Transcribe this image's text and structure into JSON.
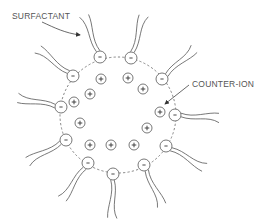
{
  "diagram": {
    "labels": {
      "surfactant": "SURFACTANT",
      "counter_ion": "COUNTER-ION"
    },
    "colors": {
      "line": "#555555",
      "dashed_boundary": "#777777",
      "background": "#ffffff"
    },
    "boundary": {
      "cx": 118,
      "cy": 115,
      "r": 58
    },
    "surfactant_heads": [
      {
        "x": 100,
        "y": 57,
        "charge": "-",
        "tail_dir": "up"
      },
      {
        "x": 131,
        "y": 58,
        "charge": "-",
        "tail_dir": "up-right"
      },
      {
        "x": 162,
        "y": 79,
        "charge": "-",
        "tail_dir": "right-up"
      },
      {
        "x": 175,
        "y": 115,
        "charge": "-",
        "tail_dir": "right"
      },
      {
        "x": 166,
        "y": 146,
        "charge": "-",
        "tail_dir": "right-down"
      },
      {
        "x": 144,
        "y": 165,
        "charge": "-",
        "tail_dir": "down-right"
      },
      {
        "x": 113,
        "y": 174,
        "charge": "-",
        "tail_dir": "down"
      },
      {
        "x": 88,
        "y": 163,
        "charge": "-",
        "tail_dir": "down-left"
      },
      {
        "x": 66,
        "y": 140,
        "charge": "-",
        "tail_dir": "left-down"
      },
      {
        "x": 61,
        "y": 107,
        "charge": "-",
        "tail_dir": "left"
      },
      {
        "x": 73,
        "y": 76,
        "charge": "-",
        "tail_dir": "up-left"
      }
    ],
    "counter_ions": [
      {
        "x": 101,
        "y": 79,
        "charge": "+"
      },
      {
        "x": 128,
        "y": 78,
        "charge": "+"
      },
      {
        "x": 143,
        "y": 89,
        "charge": "+"
      },
      {
        "x": 90,
        "y": 94,
        "charge": "+"
      },
      {
        "x": 74,
        "y": 102,
        "charge": "+"
      },
      {
        "x": 160,
        "y": 112,
        "charge": "+"
      },
      {
        "x": 80,
        "y": 123,
        "charge": "+"
      },
      {
        "x": 147,
        "y": 128,
        "charge": "+"
      },
      {
        "x": 90,
        "y": 145,
        "charge": "+"
      },
      {
        "x": 111,
        "y": 145,
        "charge": "+"
      },
      {
        "x": 134,
        "y": 145,
        "charge": "+"
      }
    ]
  }
}
